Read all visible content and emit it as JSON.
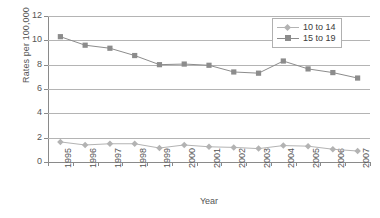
{
  "chart_data": {
    "type": "line",
    "title": "",
    "xlabel": "Year",
    "ylabel": "Rates per 100,000",
    "categories": [
      "1995",
      "1996",
      "1997",
      "1998",
      "1999",
      "2000",
      "2001",
      "2002",
      "2003",
      "2004",
      "2005",
      "2006",
      "2007"
    ],
    "series": [
      {
        "name": "10 to 14",
        "color": "#b3b3b3",
        "marker": "diamond",
        "values": [
          1.65,
          1.4,
          1.5,
          1.5,
          1.15,
          1.4,
          1.25,
          1.2,
          1.1,
          1.35,
          1.3,
          1.05,
          0.9
        ]
      },
      {
        "name": "15 to 19",
        "color": "#8c8c8c",
        "marker": "square",
        "values": [
          10.3,
          9.6,
          9.35,
          8.75,
          8.0,
          8.05,
          7.95,
          7.4,
          7.3,
          8.3,
          7.65,
          7.35,
          6.9
        ]
      }
    ],
    "ylim": [
      0,
      12
    ],
    "yticks": [
      0,
      2,
      4,
      6,
      8,
      10,
      12
    ],
    "ytick_labels": [
      "0",
      "2",
      "4",
      "6",
      "8",
      "10",
      "12"
    ],
    "grid": true,
    "grid_axis": "y",
    "legend_position": "top-right-inside",
    "background": "#ffffff",
    "axis_color": "#8a8a8a",
    "gridline_color": "#b4b4b4"
  }
}
